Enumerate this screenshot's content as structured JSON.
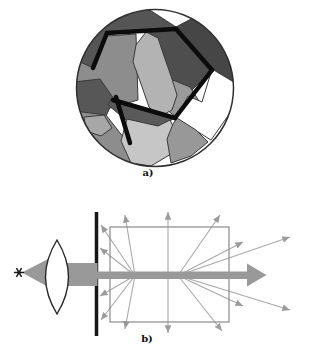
{
  "page": {
    "background": "#ffffff"
  },
  "figure": {
    "panel_a": {
      "label": "a)",
      "kind": "polycrystalline grain structure micrograph",
      "circle": {
        "cx": 155,
        "cy": 88,
        "r": 78.5,
        "outline_color": "#2f2f2f",
        "fill": "#ffffff"
      },
      "grain_outline_color": "#3a3a3a",
      "grains": [
        {
          "name": "upper-left-medium",
          "fill": "#8d8d8d",
          "points": "76,38 136,34 138,100 110,108 73,102"
        },
        {
          "name": "left-mid-dark",
          "fill": "#575757",
          "points": "74,82 100,79 114,99 106,116 74,114"
        },
        {
          "name": "top-left-dark",
          "fill": "#555555",
          "points": "76,60 80,48 98,17 142,5 176,27 107,33 91,67"
        },
        {
          "name": "top-right-dark",
          "fill": "#464646",
          "points": "176,27 204,12 228,36 237,76 231,100 212,70"
        },
        {
          "name": "right-dark",
          "fill": "#4e4e4e",
          "points": "148,30 176,27 212,70 186,96 167,77 157,48"
        },
        {
          "name": "mid-right-medium",
          "fill": "#9a9a9a",
          "points": "168,78 190,87 199,101 176,117 162,106"
        },
        {
          "name": "central-light",
          "fill": "#b3b3b3",
          "points": "136,45 146,32 158,38 164,56 171,76 177,95 172,110 159,117 149,107 141,84 133,62"
        },
        {
          "name": "white-wedge",
          "fill": "#ffffff",
          "points": "212,69 237,84 230,113 211,140 195,130 176,119 188,96 202,102"
        },
        {
          "name": "center-dark-band",
          "fill": "#5a5a5a",
          "points": "112,98 175,117 163,127 131,124 108,105"
        },
        {
          "name": "bottom-left-medium",
          "fill": "#8d8d8d",
          "points": "75,111 106,115 124,138 132,163 107,168 85,151 73,127"
        },
        {
          "name": "bottom-left-patch",
          "fill": "#a7a7a7",
          "points": "84,117 104,115 112,128 101,136 86,131"
        },
        {
          "name": "bottom-light",
          "fill": "#c6c6c6",
          "points": "127,119 158,126 170,120 178,136 171,154 151,166 131,163 121,141"
        },
        {
          "name": "bottom-right-medium",
          "fill": "#989898",
          "points": "177,118 196,130 208,142 191,156 171,163 167,139 173,124"
        }
      ],
      "special_boundaries": {
        "color": "#0c0c0c",
        "width": 4.5,
        "segments": [
          [
            93,
            68,
            107,
            33
          ],
          [
            107,
            33,
            176,
            29
          ],
          [
            176,
            29,
            212,
            70
          ],
          [
            212,
            70,
            175,
            118
          ],
          [
            175,
            118,
            113,
            100
          ],
          [
            116,
            97,
            130,
            143
          ]
        ]
      }
    },
    "panel_b": {
      "label": "b)",
      "kind": "light scattering schematic",
      "accent_gray": "#999999",
      "ray_color": "#a8a8a8",
      "ray_head_color": "#9b9b9b",
      "source": {
        "x": 19,
        "y": 272.5,
        "color": "#1c1c1c"
      },
      "cone": {
        "points": "22,272.5 52,257 52,289"
      },
      "lens": {
        "cx": 57,
        "cy": 277,
        "rx": 11.5,
        "ry": 37,
        "outline": "#262626",
        "fill": "#ffffff"
      },
      "beam_rect": {
        "x": 62,
        "y": 263,
        "w": 35.5,
        "h": 23
      },
      "shaft_rect": {
        "x": 96,
        "y": 271.5,
        "w": 152,
        "h": 7.5
      },
      "arrowhead": {
        "points": "247,263.5 247,286.5 266.5,275"
      },
      "screen_line": {
        "x": 96.5,
        "y1": 212,
        "y2": 336,
        "width": 3.5,
        "color": "#161616"
      },
      "sample_box": {
        "x": 110,
        "y": 227,
        "w": 119,
        "h": 95,
        "stroke": "#8a8a8a"
      },
      "rays": [
        [
          135,
          275.5,
          125,
          215
        ],
        [
          135,
          275.5,
          101,
          225
        ],
        [
          135,
          275.5,
          100,
          248
        ],
        [
          135,
          275.5,
          100,
          296
        ],
        [
          135,
          275.5,
          101,
          320
        ],
        [
          135,
          275.5,
          125,
          329
        ],
        [
          168,
          275.5,
          168,
          212
        ],
        [
          168,
          275.5,
          168,
          333
        ],
        [
          178,
          275.5,
          220,
          215
        ],
        [
          178,
          275.5,
          243,
          242
        ],
        [
          178,
          275.5,
          290,
          237
        ],
        [
          178,
          275.5,
          290,
          310
        ],
        [
          178,
          275.5,
          243,
          306
        ],
        [
          178,
          275.5,
          222,
          331
        ]
      ]
    }
  }
}
